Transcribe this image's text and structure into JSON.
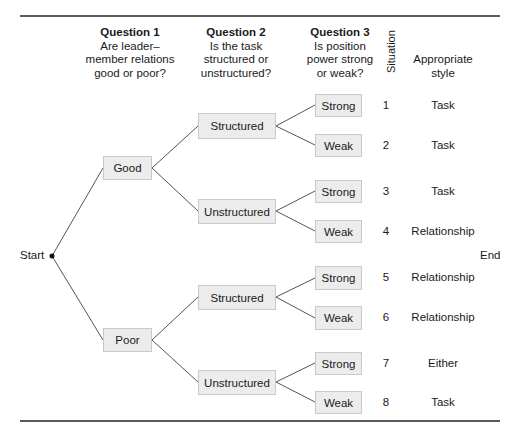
{
  "headers": {
    "q1": {
      "title": "Question 1",
      "line1": "Are leader–",
      "line2": "member relations",
      "line3": "good or poor?"
    },
    "q2": {
      "title": "Question 2",
      "line1": "Is the task",
      "line2": "structured or",
      "line3": "unstructured?"
    },
    "q3": {
      "title": "Question 3",
      "line1": "Is position",
      "line2": "power strong",
      "line3": "or weak?"
    },
    "situation": "Situation",
    "style_line1": "Appropriate",
    "style_line2": "style"
  },
  "start_label": "Start",
  "end_label": "End",
  "level1": [
    {
      "label": "Good"
    },
    {
      "label": "Poor"
    }
  ],
  "level2": [
    {
      "label": "Structured"
    },
    {
      "label": "Unstructured"
    },
    {
      "label": "Structured"
    },
    {
      "label": "Unstructured"
    }
  ],
  "level3": [
    {
      "label": "Strong"
    },
    {
      "label": "Weak"
    },
    {
      "label": "Strong"
    },
    {
      "label": "Weak"
    },
    {
      "label": "Strong"
    },
    {
      "label": "Weak"
    },
    {
      "label": "Strong"
    },
    {
      "label": "Weak"
    }
  ],
  "situations": [
    {
      "number": "1",
      "style": "Task"
    },
    {
      "number": "2",
      "style": "Task"
    },
    {
      "number": "3",
      "style": "Task"
    },
    {
      "number": "4",
      "style": "Relationship"
    },
    {
      "number": "5",
      "style": "Relationship"
    },
    {
      "number": "6",
      "style": "Relationship"
    },
    {
      "number": "7",
      "style": "Either"
    },
    {
      "number": "8",
      "style": "Task"
    }
  ],
  "colors": {
    "box_fill": "#ececec",
    "box_border": "#c9c9c9",
    "line": "#555555",
    "rule": "#5a5a5a"
  }
}
